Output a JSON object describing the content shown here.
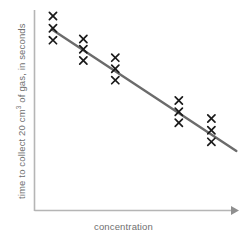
{
  "chart_data": {
    "type": "scatter",
    "title": "",
    "xlabel": "concentration",
    "ylabel_parts": {
      "before": "time to collect 20 cm",
      "superscript": "3",
      "after": " of gas, in seconds"
    },
    "ylabel": "time to collect 20 cm3 of gas, in seconds",
    "grid": false,
    "legend": "none",
    "axis_ticks": false,
    "xlim": [
      0,
      10
    ],
    "ylim": [
      0,
      10
    ],
    "marker_symbol": "x",
    "marker_color": "#1a1a1a",
    "axis_color": "#b5b5b5",
    "label_color": "#6f6f6f",
    "trendline": {
      "label": "line of best fit",
      "color": "#6b6b6b",
      "width": 2.4,
      "x": [
        0.86,
        10.17
      ],
      "y": [
        9.04,
        2.99
      ]
    },
    "series": [
      {
        "name": "repeat readings",
        "points": [
          {
            "x": 0.93,
            "y": 9.7
          },
          {
            "x": 0.93,
            "y": 9.09
          },
          {
            "x": 0.93,
            "y": 8.5
          },
          {
            "x": 2.46,
            "y": 8.56
          },
          {
            "x": 2.46,
            "y": 8.05
          },
          {
            "x": 2.46,
            "y": 7.49
          },
          {
            "x": 4.07,
            "y": 7.63
          },
          {
            "x": 4.07,
            "y": 7.08
          },
          {
            "x": 4.07,
            "y": 6.51
          },
          {
            "x": 7.27,
            "y": 5.5
          },
          {
            "x": 7.27,
            "y": 4.94
          },
          {
            "x": 7.27,
            "y": 4.39
          },
          {
            "x": 8.91,
            "y": 4.6
          },
          {
            "x": 8.91,
            "y": 4.02
          },
          {
            "x": 8.91,
            "y": 3.44
          }
        ]
      }
    ]
  }
}
